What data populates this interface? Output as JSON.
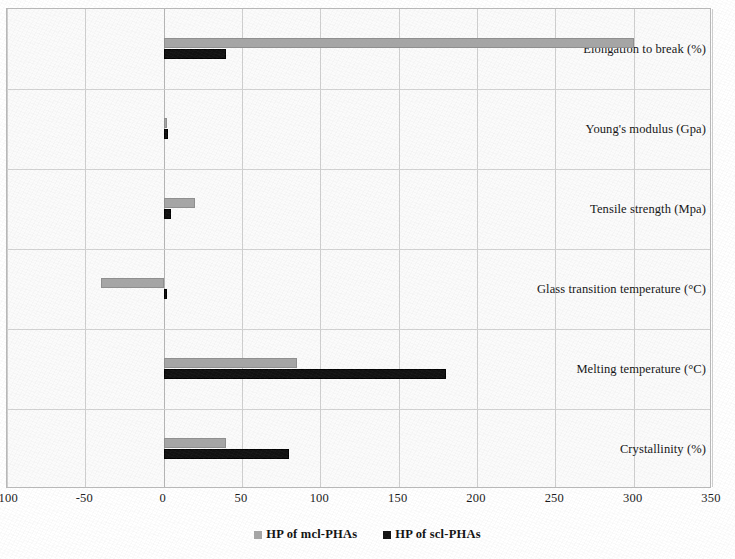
{
  "chart_data": {
    "type": "bar",
    "orientation": "horizontal",
    "title": "",
    "subtitle": "",
    "xlabel": "",
    "ylabel": "",
    "xlim": [
      -100,
      350
    ],
    "xticks": [
      -100,
      -50,
      0,
      50,
      100,
      150,
      200,
      250,
      300,
      350
    ],
    "xtick_labels": [
      "-100",
      "-50",
      "0",
      "50",
      "100",
      "150",
      "200",
      "250",
      "300",
      "350"
    ],
    "grid": true,
    "grid_axis": "both",
    "legend_position": "bottom",
    "categories": [
      "Elongation to break (%)",
      "Young's modulus (Gpa)",
      "Tensile strength (Mpa)",
      "Glass transition temperature (°C)",
      "Melting temperature (°C)",
      "Crystallinity (%)"
    ],
    "series": [
      {
        "name": "HP of mcl-PHAs",
        "color": "#a6a6a6",
        "values": [
          300,
          0.5,
          20,
          -40,
          85,
          40
        ]
      },
      {
        "name": "HP of scl-PHAs",
        "color": "#111111",
        "values": [
          40,
          3,
          5,
          2,
          180,
          80
        ]
      }
    ]
  },
  "legend": {
    "items": [
      {
        "label": "HP of mcl-PHAs",
        "swatch": "mcl"
      },
      {
        "label": "HP of scl-PHAs",
        "swatch": "scl"
      }
    ]
  }
}
